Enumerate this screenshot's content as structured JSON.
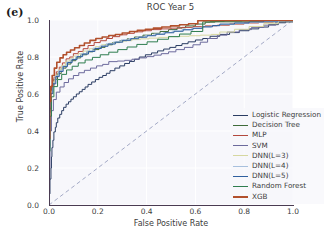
{
  "figure": {
    "panel_label": "(e)",
    "title": "ROC Year 5",
    "xlabel": "False Positive Rate",
    "ylabel": "True Positive Rate",
    "xticks": [
      "0.0",
      "0.2",
      "0.4",
      "0.6",
      "0.8",
      "1.0"
    ],
    "yticks": [
      "0.0",
      "0.2",
      "0.4",
      "0.6",
      "0.8",
      "1.0"
    ],
    "plot_background": "#f7f7fb",
    "grid_color": "#ffffff",
    "axis_color": "#4a3b52",
    "diagonal_color": "#9aa0c0"
  },
  "chart_data": {
    "type": "line",
    "title": "ROC Year 5",
    "xlabel": "False Positive Rate",
    "ylabel": "True Positive Rate",
    "xlim": [
      0.0,
      1.0
    ],
    "ylim": [
      0.0,
      1.0
    ],
    "grid": true,
    "legend_position": "lower right",
    "reference_line": {
      "name": "chance",
      "x": [
        0.0,
        1.0
      ],
      "y": [
        0.0,
        1.0
      ],
      "style": "dashed",
      "color": "#9aa0c0"
    },
    "series": [
      {
        "name": "Logistic Regression",
        "color": "#2b3d63",
        "linewidth": 1.0,
        "x": [
          0.0,
          0.004,
          0.008,
          0.01,
          0.012,
          0.016,
          0.02,
          0.026,
          0.03,
          0.036,
          0.044,
          0.052,
          0.06,
          0.07,
          0.08,
          0.09,
          0.1,
          0.112,
          0.124,
          0.136,
          0.148,
          0.16,
          0.175,
          0.19,
          0.205,
          0.22,
          0.235,
          0.25,
          0.27,
          0.29,
          0.31,
          0.33,
          0.35,
          0.37,
          0.395,
          0.42,
          0.445,
          0.47,
          0.495,
          0.52,
          0.545,
          0.57,
          0.6,
          0.63,
          0.66,
          0.7,
          0.74,
          0.78,
          0.82,
          0.86,
          0.9,
          0.94,
          0.97,
          1.0
        ],
        "y": [
          0.0,
          0.06,
          0.14,
          0.2,
          0.26,
          0.31,
          0.35,
          0.395,
          0.42,
          0.445,
          0.47,
          0.49,
          0.51,
          0.528,
          0.545,
          0.558,
          0.572,
          0.585,
          0.6,
          0.612,
          0.625,
          0.638,
          0.652,
          0.665,
          0.678,
          0.69,
          0.7,
          0.712,
          0.726,
          0.74,
          0.752,
          0.765,
          0.776,
          0.788,
          0.8,
          0.812,
          0.822,
          0.833,
          0.843,
          0.852,
          0.862,
          0.872,
          0.882,
          0.892,
          0.9,
          0.912,
          0.922,
          0.932,
          0.942,
          0.952,
          0.962,
          0.975,
          0.985,
          0.995
        ]
      },
      {
        "name": "Decision Tree",
        "color": "#3f6b3a",
        "linewidth": 1.0,
        "x": [
          0.0,
          0.002,
          0.005,
          0.01,
          0.02,
          0.035,
          0.05,
          0.07,
          0.09,
          0.11,
          0.13,
          0.155,
          0.18,
          0.205,
          0.23,
          0.26,
          0.29,
          0.32,
          0.35,
          0.385,
          0.42,
          0.455,
          0.49,
          0.525,
          0.56,
          0.6,
          0.64,
          0.68,
          0.7,
          1.0
        ],
        "y": [
          0.0,
          0.3,
          0.5,
          0.595,
          0.64,
          0.68,
          0.71,
          0.74,
          0.762,
          0.78,
          0.795,
          0.812,
          0.828,
          0.84,
          0.852,
          0.866,
          0.878,
          0.888,
          0.898,
          0.908,
          0.918,
          0.928,
          0.938,
          0.948,
          0.958,
          0.968,
          0.978,
          0.988,
          0.99,
          0.99
        ]
      },
      {
        "name": "MLP",
        "color": "#b2483d",
        "linewidth": 1.0,
        "x": [
          0.0,
          0.003,
          0.007,
          0.012,
          0.02,
          0.03,
          0.042,
          0.055,
          0.07,
          0.085,
          0.1,
          0.12,
          0.14,
          0.16,
          0.185,
          0.21,
          0.235,
          0.26,
          0.29,
          0.32,
          0.35,
          0.385,
          0.42,
          0.46,
          0.5,
          0.545,
          0.59,
          0.64,
          0.69,
          0.74,
          0.8,
          0.86,
          0.92,
          1.0
        ],
        "y": [
          0.0,
          0.32,
          0.52,
          0.6,
          0.648,
          0.69,
          0.72,
          0.745,
          0.768,
          0.79,
          0.8,
          0.818,
          0.83,
          0.845,
          0.862,
          0.878,
          0.888,
          0.9,
          0.91,
          0.92,
          0.928,
          0.936,
          0.942,
          0.948,
          0.952,
          0.956,
          0.96,
          0.964,
          0.968,
          0.972,
          0.978,
          0.984,
          0.99,
          0.998
        ]
      },
      {
        "name": "SVM",
        "color": "#6c6a9c",
        "linewidth": 1.0,
        "x": [
          0.0,
          0.004,
          0.01,
          0.018,
          0.03,
          0.045,
          0.062,
          0.08,
          0.1,
          0.122,
          0.145,
          0.17,
          0.195,
          0.22,
          0.245,
          0.25,
          0.28,
          0.31,
          0.34,
          0.37,
          0.4,
          0.43,
          0.46,
          0.49,
          0.52,
          0.555,
          0.59,
          0.62,
          0.65,
          0.69,
          0.73,
          0.78,
          0.83,
          0.88,
          0.93,
          1.0
        ],
        "y": [
          0.0,
          0.2,
          0.4,
          0.51,
          0.57,
          0.61,
          0.638,
          0.662,
          0.682,
          0.7,
          0.715,
          0.728,
          0.74,
          0.752,
          0.76,
          0.775,
          0.775,
          0.778,
          0.782,
          0.788,
          0.795,
          0.802,
          0.81,
          0.818,
          0.828,
          0.84,
          0.852,
          0.866,
          0.88,
          0.9,
          0.918,
          0.935,
          0.948,
          0.96,
          0.972,
          0.99
        ]
      },
      {
        "name": "DNN(L=3)",
        "color": "#d6d7a0",
        "linewidth": 1.0,
        "x": [
          0.0,
          0.003,
          0.008,
          0.015,
          0.025,
          0.038,
          0.052,
          0.068,
          0.085,
          0.1,
          0.12,
          0.14,
          0.165,
          0.19,
          0.215,
          0.245,
          0.275,
          0.305,
          0.34,
          0.375,
          0.41,
          0.45,
          0.49,
          0.53,
          0.575,
          0.62,
          0.665,
          0.7,
          0.76,
          0.82,
          0.88,
          0.94,
          1.0
        ],
        "y": [
          0.0,
          0.34,
          0.54,
          0.615,
          0.665,
          0.702,
          0.73,
          0.755,
          0.778,
          0.79,
          0.805,
          0.818,
          0.832,
          0.845,
          0.856,
          0.866,
          0.874,
          0.882,
          0.888,
          0.894,
          0.898,
          0.902,
          0.906,
          0.91,
          0.912,
          0.915,
          0.918,
          0.922,
          0.935,
          0.95,
          0.965,
          0.98,
          0.996
        ]
      },
      {
        "name": "DNN(L=4)",
        "color": "#a8c0dd",
        "linewidth": 1.0,
        "x": [
          0.0,
          0.003,
          0.008,
          0.015,
          0.026,
          0.04,
          0.055,
          0.072,
          0.09,
          0.11,
          0.132,
          0.155,
          0.18,
          0.208,
          0.235,
          0.265,
          0.295,
          0.328,
          0.36,
          0.395,
          0.43,
          0.468,
          0.505,
          0.545,
          0.585,
          0.625,
          0.665,
          0.7,
          0.76,
          0.82,
          0.88,
          0.94,
          1.0
        ],
        "y": [
          0.0,
          0.33,
          0.53,
          0.61,
          0.66,
          0.698,
          0.726,
          0.75,
          0.772,
          0.788,
          0.802,
          0.818,
          0.832,
          0.848,
          0.86,
          0.872,
          0.882,
          0.892,
          0.9,
          0.908,
          0.916,
          0.924,
          0.932,
          0.94,
          0.948,
          0.956,
          0.962,
          0.968,
          0.976,
          0.982,
          0.988,
          0.992,
          0.998
        ]
      },
      {
        "name": "DNN(L=5)",
        "color": "#2f5f9e",
        "linewidth": 1.0,
        "x": [
          0.0,
          0.003,
          0.008,
          0.016,
          0.028,
          0.042,
          0.058,
          0.076,
          0.095,
          0.115,
          0.138,
          0.162,
          0.188,
          0.215,
          0.242,
          0.272,
          0.302,
          0.335,
          0.368,
          0.402,
          0.438,
          0.475,
          0.512,
          0.55,
          0.59,
          0.63,
          0.67,
          0.7,
          0.76,
          0.82,
          0.88,
          0.94,
          1.0
        ],
        "y": [
          0.0,
          0.31,
          0.52,
          0.602,
          0.655,
          0.694,
          0.722,
          0.748,
          0.77,
          0.786,
          0.802,
          0.816,
          0.83,
          0.846,
          0.858,
          0.87,
          0.88,
          0.89,
          0.899,
          0.907,
          0.915,
          0.923,
          0.931,
          0.939,
          0.947,
          0.955,
          0.963,
          0.97,
          0.978,
          0.984,
          0.99,
          0.994,
          0.999
        ]
      },
      {
        "name": "Random Forest",
        "color": "#2e7d4f",
        "linewidth": 1.0,
        "x": [
          0.0,
          0.004,
          0.01,
          0.02,
          0.035,
          0.052,
          0.072,
          0.095,
          0.12,
          0.148,
          0.178,
          0.21,
          0.245,
          0.282,
          0.32,
          0.36,
          0.402,
          0.445,
          0.49,
          0.535,
          0.582,
          0.63,
          0.66,
          0.72,
          0.79,
          0.86,
          0.93,
          1.0
        ],
        "y": [
          0.0,
          0.29,
          0.48,
          0.585,
          0.64,
          0.678,
          0.706,
          0.73,
          0.75,
          0.768,
          0.784,
          0.798,
          0.812,
          0.826,
          0.84,
          0.854,
          0.868,
          0.882,
          0.896,
          0.91,
          0.924,
          0.938,
          0.99,
          0.992,
          0.994,
          0.996,
          0.997,
          0.999
        ]
      },
      {
        "name": "XGB",
        "color": "#b2502c",
        "linewidth": 1.6,
        "x": [
          0.0,
          0.003,
          0.007,
          0.013,
          0.022,
          0.032,
          0.045,
          0.058,
          0.072,
          0.088,
          0.105,
          0.125,
          0.145,
          0.168,
          0.192,
          0.218,
          0.245,
          0.272,
          0.3,
          0.33,
          0.362,
          0.395,
          0.428,
          0.462,
          0.498,
          0.535,
          0.572,
          0.61,
          0.645,
          0.66,
          0.72,
          0.8,
          0.88,
          1.0
        ],
        "y": [
          0.0,
          0.36,
          0.56,
          0.64,
          0.7,
          0.74,
          0.772,
          0.795,
          0.812,
          0.826,
          0.838,
          0.85,
          0.862,
          0.876,
          0.89,
          0.9,
          0.908,
          0.916,
          0.922,
          0.93,
          0.938,
          0.944,
          0.95,
          0.956,
          0.962,
          0.968,
          0.974,
          0.98,
          0.996,
          0.998,
          0.998,
          0.998,
          0.998,
          0.999
        ]
      }
    ]
  },
  "legend": {
    "items": [
      {
        "label": "Logistic Regression",
        "color": "#2b3d63",
        "width": 1.2
      },
      {
        "label": "Decision Tree",
        "color": "#3f6b3a",
        "width": 1.2
      },
      {
        "label": "MLP",
        "color": "#b2483d",
        "width": 1.2
      },
      {
        "label": "SVM",
        "color": "#6c6a9c",
        "width": 1.2
      },
      {
        "label": "DNN(L=3)",
        "color": "#d6d7a0",
        "width": 1.2
      },
      {
        "label": "DNN(L=4)",
        "color": "#a8c0dd",
        "width": 1.2
      },
      {
        "label": "DNN(L=5)",
        "color": "#2f5f9e",
        "width": 1.2
      },
      {
        "label": "Random Forest",
        "color": "#2e7d4f",
        "width": 1.2
      },
      {
        "label": "XGB",
        "color": "#b2502c",
        "width": 2.0
      }
    ]
  }
}
